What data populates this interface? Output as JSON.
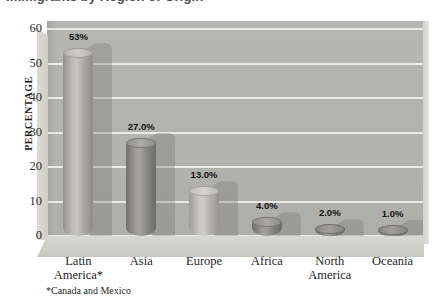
{
  "chart_data": {
    "type": "bar",
    "title": "Immigrants by Region of Origin",
    "xlabel": "",
    "ylabel": "PERCENTAGE",
    "ylim": [
      0,
      60
    ],
    "ytick_values": [
      "60",
      "50",
      "40",
      "30",
      "20",
      "10",
      "0"
    ],
    "grid": true,
    "legend": "none",
    "style": "3d-cylinder",
    "footnote": "*Canada and Mexico",
    "categories": [
      "Latin America*",
      "Asia",
      "Europe",
      "Africa",
      "North America",
      "Oceania"
    ],
    "category_lines": [
      [
        "Latin",
        "America*"
      ],
      [
        "Asia",
        ""
      ],
      [
        "Europe",
        ""
      ],
      [
        "Africa",
        ""
      ],
      [
        "North",
        "America"
      ],
      [
        "Oceania",
        ""
      ]
    ],
    "values": [
      53.0,
      27.0,
      13.0,
      4.0,
      2.0,
      1.0
    ],
    "data_labels": [
      "53%",
      "27.0%",
      "13.0%",
      "4.0%",
      "2.0%",
      "1.0%"
    ],
    "bar_colors": [
      "#b0aea6",
      "#8e8d86",
      "#b9b7b0",
      "#8b8a83",
      "#84837c",
      "#83827b"
    ]
  },
  "colors": {
    "plot_background": "#b2b2ae",
    "gridline": "#f0f0ec",
    "floor": "#d2d2cc",
    "page_background": "#ffffff",
    "text": "#1f1f1f"
  }
}
